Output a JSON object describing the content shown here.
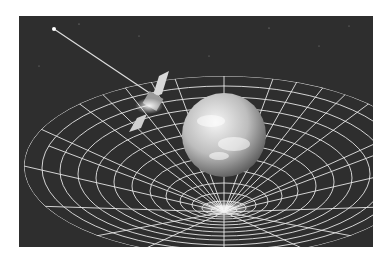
{
  "image": {
    "alt": "Illustration of spacetime curvature: Earth sitting in a warped grid funnel with a satellite in orbit emitting a beam",
    "subjects": [
      "earth",
      "spacetime-grid",
      "satellite",
      "light-beam",
      "starfield"
    ],
    "colors": {
      "background": "#ffffff",
      "space": "#2e2e2e",
      "grid": "#e6e6e6",
      "earth_light": "#f2f2f2",
      "earth_dark": "#6a6a6a"
    }
  }
}
